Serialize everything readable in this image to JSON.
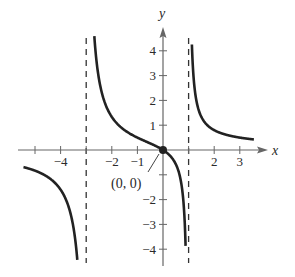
{
  "chart_data": {
    "type": "line",
    "title": "",
    "function": "y = 2x / (x^2 + 2x - 3)",
    "xlabel": "x",
    "ylabel": "y",
    "xlim": [
      -5.5,
      4.2
    ],
    "ylim": [
      -4.5,
      4.8
    ],
    "grid": false,
    "legend": null,
    "x_ticks": [
      -5,
      -4,
      -3,
      -2,
      -1,
      1,
      2,
      3
    ],
    "x_tick_labels": [
      {
        "value": -4,
        "label": "−4"
      },
      {
        "value": -2,
        "label": "−2"
      },
      {
        "value": -1,
        "label": "−1"
      },
      {
        "value": 2,
        "label": "2"
      },
      {
        "value": 3,
        "label": "3"
      }
    ],
    "y_ticks": [
      -4,
      -3,
      -2,
      -1,
      1,
      2,
      3,
      4
    ],
    "y_tick_labels": [
      {
        "value": 4,
        "label": "4"
      },
      {
        "value": 3,
        "label": "3"
      },
      {
        "value": 2,
        "label": "2"
      },
      {
        "value": 1,
        "label": "1"
      },
      {
        "value": -2,
        "label": "−2"
      },
      {
        "value": -3,
        "label": "−3"
      },
      {
        "value": -4,
        "label": "−4"
      }
    ],
    "vertical_asymptotes": [
      -3,
      1
    ],
    "series": [
      {
        "name": "branch-left",
        "x": [
          -5.5,
          -5,
          -4.5,
          -4,
          -3.5,
          -3.2
        ],
        "y": [
          -0.65,
          -0.83,
          -1.2,
          -1.6,
          -3.1,
          -5.3
        ]
      },
      {
        "name": "branch-middle",
        "x": [
          -2.85,
          -2.5,
          -2,
          -1.5,
          -1,
          -0.5,
          0,
          0.5,
          0.8,
          0.9
        ],
        "y": [
          4.6,
          2.86,
          1.33,
          0.8,
          0.5,
          0.29,
          0,
          -0.57,
          -2.1,
          -4.6
        ]
      },
      {
        "name": "branch-right",
        "x": [
          1.15,
          1.5,
          2,
          2.5,
          3,
          3.5
        ],
        "y": [
          5.0,
          1.33,
          0.8,
          0.57,
          0.5,
          0.43
        ]
      }
    ],
    "annotations": [
      {
        "text": "(0, 0)",
        "x": 0,
        "y": 0,
        "marker": "filled-circle"
      }
    ]
  }
}
